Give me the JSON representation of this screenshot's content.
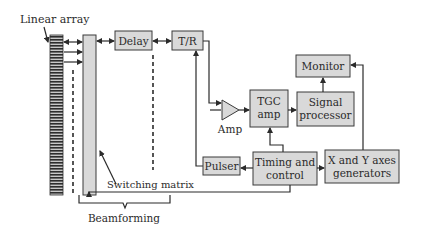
{
  "diagram": {
    "type": "ultrasound-imaging-block-diagram",
    "labels": {
      "linear_array": "Linear array",
      "switching_matrix": "Switching matrix",
      "beamforming": "Beamforming",
      "amp": "Amp"
    },
    "blocks": {
      "delay": {
        "line1": "Delay"
      },
      "tr": {
        "line1": "T/R"
      },
      "tgc": {
        "line1": "TGC",
        "line2": "amp"
      },
      "signal_processor": {
        "line1": "Signal",
        "line2": "processor"
      },
      "monitor": {
        "line1": "Monitor"
      },
      "pulser": {
        "line1": "Pulser"
      },
      "timing": {
        "line1": "Timing and",
        "line2": "control"
      },
      "xy": {
        "line1": "X and Y axes",
        "line2": "generators"
      }
    },
    "colors": {
      "box_fill": "#d9d9d9",
      "stroke": "#2b2b2b",
      "background": "#ffffff"
    }
  }
}
